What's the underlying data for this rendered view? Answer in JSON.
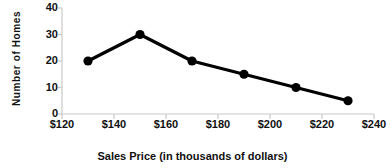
{
  "chart_data": {
    "type": "line",
    "title": "",
    "xlabel": "Sales Price (in thousands of dollars)",
    "ylabel": "Number of Homes",
    "x": [
      130,
      150,
      170,
      190,
      210,
      230
    ],
    "values": [
      20,
      30,
      20,
      15,
      10,
      5
    ],
    "series": [
      {
        "name": "Number of Homes",
        "values": [
          20,
          30,
          20,
          15,
          10,
          5
        ]
      }
    ],
    "xlim": [
      120,
      240
    ],
    "ylim": [
      0,
      40
    ],
    "x_tick_labels": [
      "$120",
      "$140",
      "$160",
      "$180",
      "$200",
      "$220",
      "$240"
    ],
    "x_tick_values": [
      120,
      140,
      160,
      180,
      200,
      220,
      240
    ],
    "y_tick_labels": [
      "0",
      "10",
      "20",
      "30",
      "40"
    ],
    "y_tick_values": [
      0,
      10,
      20,
      30,
      40
    ],
    "grid": false,
    "legend": "none",
    "marker": "filled-circle",
    "line_color": "#000000",
    "marker_color": "#000000",
    "axis_color": "#c9c9c9",
    "background_color": "#ffffff"
  }
}
